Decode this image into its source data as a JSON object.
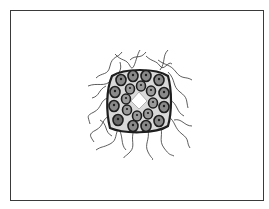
{
  "figure": {
    "frame_color": "#3a3a3a",
    "ink_color": "#1e1e1e",
    "cell_fill": "#8a8a8a",
    "cluster_center": [
      139,
      101
    ],
    "outer_ring_cells": 12,
    "inner_ring_cells": 8
  }
}
